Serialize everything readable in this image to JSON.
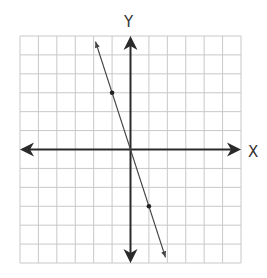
{
  "chart_data": {
    "type": "line",
    "title": "",
    "xlabel": "X",
    "ylabel": "Y",
    "xlim": [
      -6,
      6
    ],
    "ylim": [
      -6,
      6
    ],
    "grid": true,
    "grid_step": 1,
    "tick_labels": false,
    "series": [
      {
        "name": "line",
        "equation": "y = -3x",
        "slope": -3,
        "intercept": 0,
        "x": [
          -1.9,
          1.9
        ],
        "y": [
          5.7,
          -5.7
        ],
        "arrows_both_ends": true
      }
    ],
    "marked_points": [
      {
        "x": -1,
        "y": 3
      },
      {
        "x": 1,
        "y": -3
      }
    ]
  },
  "colors": {
    "grid": "#c8c8c8",
    "axis": "#2a2a2a",
    "line": "#444444",
    "point": "#222222"
  }
}
